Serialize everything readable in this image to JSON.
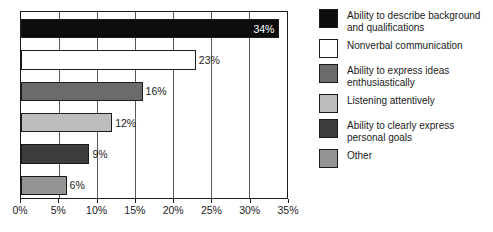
{
  "chart_data": {
    "type": "bar",
    "orientation": "horizontal",
    "title": "",
    "subtitle": "",
    "xlabel": "",
    "ylabel": "",
    "xlim": [
      0,
      35
    ],
    "x_ticks": [
      0,
      5,
      10,
      15,
      20,
      25,
      30,
      35
    ],
    "x_tick_labels": [
      "0%",
      "5%",
      "10%",
      "15%",
      "20%",
      "25%",
      "30%",
      "35%"
    ],
    "grid": true,
    "grid_axis": "x",
    "legend_position": "right",
    "categories": [
      "Ability to describe background and qualifications",
      "Nonverbal communication",
      "Ability to express ideas enthusiastically",
      "Listening attentively",
      "Ability to clearly express personal goals",
      "Other"
    ],
    "values": [
      34,
      23,
      16,
      12,
      9,
      6
    ],
    "data_labels": [
      "34%",
      "23%",
      "16%",
      "12%",
      "9%",
      "6%"
    ],
    "label_placement": [
      "inside",
      "outside",
      "outside",
      "outside",
      "outside",
      "outside"
    ],
    "colors": [
      "#0d0d0d",
      "#ffffff",
      "#6b6b6b",
      "#bdbdbd",
      "#3c3c3c",
      "#949494"
    ],
    "bar_edge_color": "#1a1a1a",
    "plot_border_color": "#1a1a1a",
    "gridline_color": "#5a5a5a",
    "background_color": "#ffffff"
  },
  "legend": {
    "items": [
      {
        "label": "Ability to describe background\nand qualifications",
        "color": "#0d0d0d"
      },
      {
        "label": "Nonverbal communication",
        "color": "#ffffff"
      },
      {
        "label": "Ability to express ideas\nenthusiastically",
        "color": "#6b6b6b"
      },
      {
        "label": "Listening attentively",
        "color": "#bdbdbd"
      },
      {
        "label": "Ability to clearly express\npersonal goals",
        "color": "#3c3c3c"
      },
      {
        "label": "Other",
        "color": "#949494"
      }
    ]
  }
}
